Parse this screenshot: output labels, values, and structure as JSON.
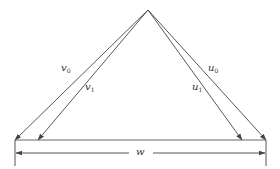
{
  "diagram": {
    "type": "vector-triangle",
    "stroke_color": "#444444",
    "apex": {
      "x": 148,
      "y": 10
    },
    "base_y": 140,
    "vectors": [
      {
        "id": "v0",
        "symbol": "v",
        "subscript": "0",
        "from": [
          148,
          10
        ],
        "to": [
          15,
          140
        ]
      },
      {
        "id": "v1",
        "symbol": "v",
        "subscript": "1",
        "from": [
          148,
          10
        ],
        "to": [
          38,
          140
        ]
      },
      {
        "id": "u1",
        "symbol": "u",
        "subscript": "1",
        "from": [
          148,
          10
        ],
        "to": [
          242,
          140
        ]
      },
      {
        "id": "u0",
        "symbol": "u",
        "subscript": "0",
        "from": [
          148,
          10
        ],
        "to": [
          266,
          140
        ]
      }
    ],
    "labels": {
      "v0": {
        "symbol": "v",
        "sub": "0"
      },
      "v1": {
        "symbol": "v",
        "sub": "1"
      },
      "u0": {
        "symbol": "u",
        "sub": "0"
      },
      "u1": {
        "symbol": "u",
        "sub": "1"
      },
      "w": {
        "symbol": "w"
      }
    },
    "dimension": {
      "label": "w",
      "from_x": 15,
      "to_x": 266,
      "y": 153
    }
  }
}
